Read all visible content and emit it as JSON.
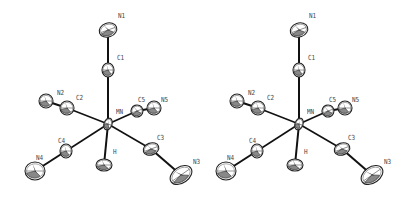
{
  "figure": {
    "type": "ORTEP stereo pair",
    "molecule_center": "MN",
    "views": [
      {
        "name": "left-view",
        "offset_x": 0
      },
      {
        "name": "right-view",
        "offset_x": 191
      }
    ],
    "atoms": [
      {
        "id": "N1",
        "label": "N1",
        "x": 108,
        "y": 30,
        "rx": 9,
        "ry": 7,
        "rot": -20,
        "lx": 118,
        "ly": 13
      },
      {
        "id": "C1",
        "label": "C1",
        "x": 108,
        "y": 70,
        "rx": 6,
        "ry": 7,
        "rot": 0,
        "lx": 117,
        "ly": 55
      },
      {
        "id": "C2",
        "label": "C2",
        "x": 67,
        "y": 108,
        "rx": 7,
        "ry": 7,
        "rot": 0,
        "lx": 76,
        "ly": 95
      },
      {
        "id": "N2",
        "label": "N2",
        "x": 46,
        "y": 101,
        "rx": 7,
        "ry": 7,
        "rot": 0,
        "lx": 57,
        "ly": 90
      },
      {
        "id": "MN",
        "label": "MN",
        "x": 108,
        "y": 124,
        "rx": 4,
        "ry": 6,
        "rot": 20,
        "lx": 116,
        "ly": 109
      },
      {
        "id": "C5",
        "label": "C5",
        "x": 137,
        "y": 111,
        "rx": 6,
        "ry": 6,
        "rot": -20,
        "lx": 138,
        "ly": 97
      },
      {
        "id": "N5",
        "label": "N5",
        "x": 154,
        "y": 108,
        "rx": 7,
        "ry": 7,
        "rot": 0,
        "lx": 161,
        "ly": 97
      },
      {
        "id": "C4",
        "label": "C4",
        "x": 66,
        "y": 151,
        "rx": 6,
        "ry": 7,
        "rot": 0,
        "lx": 58,
        "ly": 138
      },
      {
        "id": "N4",
        "label": "N4",
        "x": 35,
        "y": 171,
        "rx": 10,
        "ry": 9,
        "rot": 0,
        "lx": 36,
        "ly": 155
      },
      {
        "id": "H",
        "label": "H",
        "x": 104,
        "y": 165,
        "rx": 8,
        "ry": 6,
        "rot": 0,
        "lx": 113,
        "ly": 149
      },
      {
        "id": "C3",
        "label": "C3",
        "x": 151,
        "y": 149,
        "rx": 8,
        "ry": 6,
        "rot": -20,
        "lx": 157,
        "ly": 135
      },
      {
        "id": "N3",
        "label": "N3",
        "x": 181,
        "y": 175,
        "rx": 12,
        "ry": 8,
        "rot": -35,
        "lx": 193,
        "ly": 159
      }
    ],
    "bonds": [
      [
        "MN",
        "C1"
      ],
      [
        "C1",
        "N1"
      ],
      [
        "MN",
        "C2"
      ],
      [
        "C2",
        "N2"
      ],
      [
        "MN",
        "C5"
      ],
      [
        "C5",
        "N5"
      ],
      [
        "MN",
        "C4"
      ],
      [
        "C4",
        "N4"
      ],
      [
        "MN",
        "H"
      ],
      [
        "MN",
        "C3"
      ],
      [
        "C3",
        "N3"
      ]
    ],
    "colors": {
      "bond": "#111111",
      "ellipse_stroke": "#222222",
      "ellipse_fill": "#ffffff",
      "shade": "#888888",
      "label": "#444444"
    }
  }
}
